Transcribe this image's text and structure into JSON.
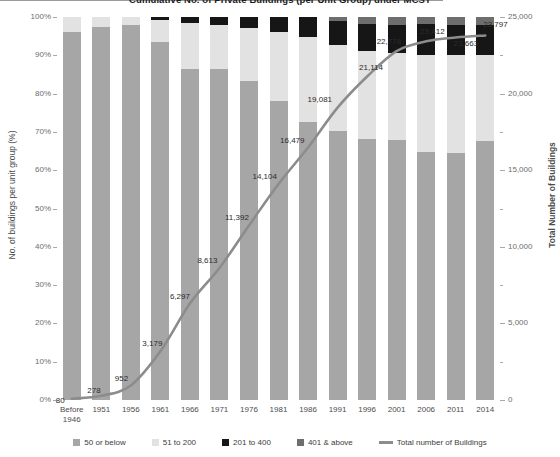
{
  "chart_data": {
    "type": "bar",
    "title": "Cumulative No. of Private Buildings (per Unit Group) under MCST",
    "xlabel": "",
    "ylabel": "No. of buildings per unit group (%)",
    "y2label": "Total Number of Buildings",
    "ylim": [
      0,
      100
    ],
    "y2lim": [
      0,
      25000
    ],
    "grid": false,
    "legend_position": "bottom",
    "stacked": true,
    "stack_mode": "percent",
    "categories": [
      "Before\n1946",
      "1951",
      "1956",
      "1961",
      "1966",
      "1971",
      "1976",
      "1981",
      "1986",
      "1991",
      "1996",
      "2001",
      "2006",
      "2011",
      "2014"
    ],
    "category_labels": [
      "Before 1946",
      "1951",
      "1956",
      "1961",
      "1966",
      "1971",
      "1976",
      "1981",
      "1986",
      "1991",
      "1996",
      "2001",
      "2006",
      "2011",
      "2014"
    ],
    "y_tick_labels": [
      "0%",
      "10%",
      "20%",
      "30%",
      "40%",
      "50%",
      "60%",
      "70%",
      "80%",
      "90%",
      "100%"
    ],
    "y_tick_values": [
      0,
      10,
      20,
      30,
      40,
      50,
      60,
      70,
      80,
      90,
      100
    ],
    "y2_tick_labels": [
      "0",
      "5,000",
      "10,000",
      "15,000",
      "20,000",
      "25,000"
    ],
    "y2_tick_values": [
      0,
      5000,
      10000,
      15000,
      20000,
      25000
    ],
    "series": [
      {
        "name": "50 or below",
        "color": "#a6a6a6",
        "values": [
          96.2,
          97.5,
          98.0,
          93.5,
          86.5,
          86.3,
          83.2,
          78.2,
          72.7,
          70.2,
          68.2,
          68.0,
          64.8,
          64.4,
          67.5
        ]
      },
      {
        "name": "51 to 200",
        "color": "#e2e2e2",
        "values": [
          3.8,
          2.5,
          2.0,
          5.8,
          11.9,
          11.6,
          13.9,
          18.0,
          22.1,
          22.6,
          23.0,
          22.5,
          25.3,
          25.7,
          22.5
        ]
      },
      {
        "name": "201 to 400",
        "color": "#161616",
        "values": [
          0.0,
          0.0,
          0.0,
          0.7,
          1.6,
          2.1,
          2.9,
          3.8,
          5.2,
          6.2,
          7.0,
          7.4,
          8.0,
          7.9,
          8.0
        ]
      },
      {
        "name": "401 & above",
        "color": "#6e6e6e",
        "values": [
          0.0,
          0.0,
          0.0,
          0.0,
          0.0,
          0.0,
          0.0,
          0.0,
          0.0,
          1.0,
          1.8,
          2.1,
          1.9,
          2.0,
          2.0
        ]
      }
    ],
    "line_series": {
      "name": "Total number of Buildings",
      "color": "#8c8c8c",
      "axis": "right",
      "values": [
        80,
        278,
        952,
        3179,
        6297,
        8613,
        11392,
        14104,
        16479,
        19081,
        21114,
        22778,
        23412,
        23663,
        23797
      ],
      "labels": [
        "80",
        "278",
        "952",
        "3,179",
        "6,297",
        "8,613",
        "11,392",
        "14,104",
        "16,479",
        "19,081",
        "21,114",
        "22,778",
        "23,412",
        "23,663",
        "23,797"
      ]
    },
    "legend": [
      {
        "label": "50 or below",
        "color": "#a6a6a6",
        "marker": "square"
      },
      {
        "label": "51 to 200",
        "color": "#e2e2e2",
        "marker": "square"
      },
      {
        "label": "201 to 400",
        "color": "#161616",
        "marker": "square"
      },
      {
        "label": "401 & above",
        "color": "#6e6e6e",
        "marker": "square"
      },
      {
        "label": "Total number of Buildings",
        "color": "#8c8c8c",
        "marker": "line"
      }
    ]
  }
}
